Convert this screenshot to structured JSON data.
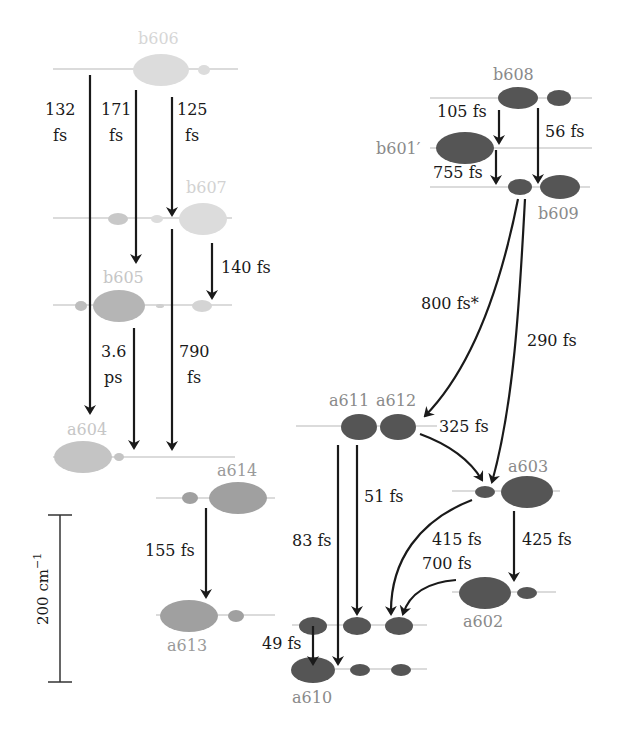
{
  "colors": {
    "pale": "#d9d9d9",
    "pale_text": "#cfcfcf",
    "mid": "#a6a6a6",
    "mid_text": "#9a9a9a",
    "dark": "#555555",
    "dark_text": "#8a8a8a",
    "arrow": "#1a1a1a",
    "level_line": "#b8b8b8"
  },
  "scale_bar": {
    "label": "200 cm",
    "superscript": "−1"
  },
  "pigments": {
    "b606": "b606",
    "b607": "b607",
    "b605": "b605",
    "a604": "a604",
    "a614": "a614",
    "a613": "a613",
    "b608": "b608",
    "b601p": "b601′",
    "b609": "b609",
    "a611": "a611",
    "a612": "a612",
    "a603": "a603",
    "a602": "a602",
    "a610": "a610"
  },
  "transfers": {
    "t132_a": "132",
    "t132_b": "fs",
    "t171_a": "171",
    "t171_b": "fs",
    "t125_a": "125",
    "t125_b": "fs",
    "t140": "140 fs",
    "t36_a": "3.6",
    "t36_b": "ps",
    "t790_a": "790",
    "t790_b": "fs",
    "t155": "155 fs",
    "t105": "105 fs",
    "t56": "56 fs",
    "t755": "755 fs",
    "t800": "800 fs*",
    "t290": "290 fs",
    "t325": "325 fs",
    "t51": "51 fs",
    "t83": "83 fs",
    "t415": "415 fs",
    "t425": "425 fs",
    "t700": "700 fs",
    "t49": "49 fs"
  }
}
